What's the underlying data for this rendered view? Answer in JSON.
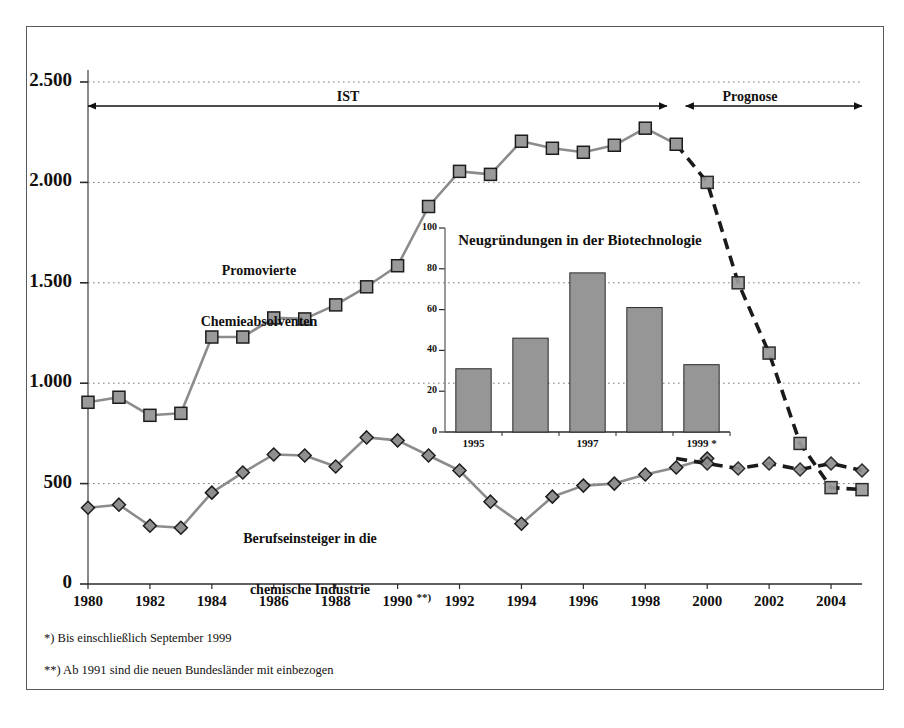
{
  "figure": {
    "background_color": "#ffffff",
    "frame_color": "#555a5e"
  },
  "chart_data": {
    "type": "line",
    "title": "",
    "xlabel": "",
    "ylabel": "",
    "xlim": [
      1980,
      2005
    ],
    "ylim": [
      0,
      2500
    ],
    "grid": true,
    "grid_style": "dotted horizontal",
    "legend_position": "inline annotations",
    "x": [
      1980,
      1981,
      1982,
      1983,
      1984,
      1985,
      1986,
      1987,
      1988,
      1989,
      1990,
      1991,
      1992,
      1993,
      1994,
      1995,
      1996,
      1997,
      1998,
      1999,
      2000,
      2001,
      2002,
      2003,
      2004,
      2005
    ],
    "y_ticks": [
      0,
      500,
      1000,
      1500,
      2000,
      2500
    ],
    "y_tick_labels": [
      "0",
      "500",
      "1.000",
      "1.500",
      "2.000",
      "2.500"
    ],
    "x_ticks": [
      1980,
      1982,
      1984,
      1986,
      1988,
      1990,
      1992,
      1994,
      1996,
      1998,
      2000,
      2002,
      2004
    ],
    "x_tick_labels": [
      "1980",
      "1982",
      "1984",
      "1986",
      "1988",
      "1990",
      "1992",
      "1994",
      "1996",
      "1998",
      "2000",
      "2002",
      "2004"
    ],
    "x_tick_annotation": "**)",
    "series": [
      {
        "name": "Promovierte Chemieabsolventen",
        "marker": "square",
        "color": "#8c8c8c",
        "marker_fill": "#9a9a9a",
        "marker_edge": "#1c1c1c",
        "actual_values": [
          905,
          930,
          840,
          850,
          1230,
          1230,
          1325,
          1320,
          1390,
          1480,
          1585,
          1880,
          2055,
          2040,
          2205,
          2170,
          2150,
          2185,
          2270,
          2190
        ],
        "forecast_values": [
          2190,
          2000,
          1500,
          1150,
          700,
          480,
          470
        ],
        "forecast_x": [
          1999,
          2000,
          2001,
          2002,
          2003,
          2004,
          2005
        ],
        "forecast_style": "dashed"
      },
      {
        "name": "Berufseinsteiger in die chemische Industrie",
        "marker": "diamond",
        "color": "#8c8c8c",
        "marker_fill": "#8f8f8f",
        "marker_edge": "#1c1c1c",
        "actual_values": [
          380,
          395,
          290,
          280,
          455,
          555,
          645,
          640,
          585,
          730,
          715,
          640,
          565,
          410,
          300,
          435,
          490,
          500,
          545,
          580,
          625
        ],
        "forecast_values": [
          625,
          600,
          575,
          600,
          570,
          600,
          565
        ],
        "forecast_x": [
          1999,
          2000,
          2001,
          2002,
          2003,
          2004,
          2005
        ],
        "forecast_style": "dashed"
      }
    ],
    "annotations": [
      {
        "text": "IST",
        "x_from": 1980,
        "x_to": 1998.7,
        "type": "double-arrow-span"
      },
      {
        "text": "Prognose",
        "x_from": 1999.3,
        "x_to": 2005,
        "type": "double-arrow-span"
      }
    ],
    "inset": {
      "type": "bar",
      "title": "Neugründungen in der Biotechnologie",
      "categories": [
        "1995",
        "1996",
        "1997",
        "1998",
        "1999 *"
      ],
      "category_tick_labels": [
        "1995",
        "1997",
        "1999 *"
      ],
      "values": [
        31,
        46,
        78,
        61,
        33
      ],
      "ylim": [
        0,
        100
      ],
      "y_ticks": [
        0,
        20,
        40,
        60,
        80,
        100
      ],
      "y_tick_labels": [
        "0",
        "20",
        "40",
        "60",
        "80",
        "100"
      ],
      "bar_color": "#969696",
      "bar_edge": "#2a2a2a",
      "grid": true
    }
  },
  "series_labels": {
    "upper_line1": "Promovierte",
    "upper_line2": "Chemieabsolventen",
    "lower_line1": "Berufseinsteiger in die",
    "lower_line2": "chemische Industrie"
  },
  "phases": {
    "ist": "IST",
    "prognose": "Prognose"
  },
  "footnotes": {
    "first": "*) Bis einschließlich September 1999",
    "second": "**) Ab 1991 sind die neuen Bundesländer mit einbezogen"
  }
}
